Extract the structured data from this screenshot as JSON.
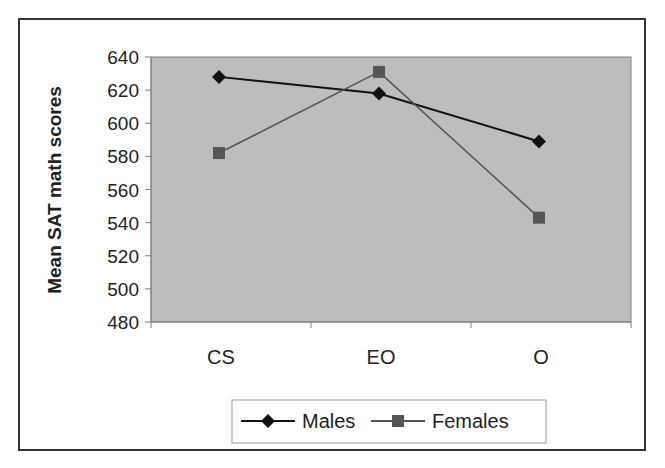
{
  "chart_data": {
    "type": "line",
    "title": "",
    "xlabel": "",
    "ylabel": "Mean SAT math scores",
    "categories": [
      "CS",
      "EO",
      "O"
    ],
    "series": [
      {
        "name": "Males",
        "values": [
          628,
          618,
          589
        ],
        "color": "#111111",
        "marker": "diamond"
      },
      {
        "name": "Females",
        "values": [
          582,
          631,
          543
        ],
        "color": "#555555",
        "marker": "square"
      }
    ],
    "ylim": [
      480,
      640
    ],
    "yticks": [
      480,
      500,
      520,
      540,
      560,
      580,
      600,
      620,
      640
    ],
    "grid": false,
    "legend_position": "bottom",
    "plot_background": "#bdbdbd"
  },
  "legend": {
    "items": [
      {
        "label": "Males"
      },
      {
        "label": "Females"
      }
    ]
  }
}
